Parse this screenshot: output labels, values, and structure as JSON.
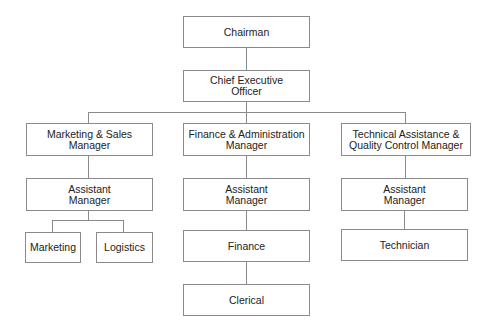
{
  "chart": {
    "type": "org-chart",
    "nodes": {
      "chairman": "Chairman",
      "ceo_line1": "Chief Executive",
      "ceo_line2": "Officer",
      "ms_manager_line1": "Marketing & Sales",
      "ms_manager_line2": "Manager",
      "fa_manager_line1": "Finance & Administration",
      "fa_manager_line2": "Manager",
      "ta_manager_line1": "Technical Assistance &",
      "ta_manager_line2": "Quality Control Manager",
      "asst_line1": "Assistant",
      "asst_line2": "Manager",
      "marketing": "Marketing",
      "logistics": "Logistics",
      "finance": "Finance",
      "technician": "Technician",
      "clerical": "Clerical"
    },
    "hierarchy": {
      "Chairman": [
        "Chief Executive Officer"
      ],
      "Chief Executive Officer": [
        "Marketing & Sales Manager",
        "Finance & Administration Manager",
        "Technical Assistance & Quality Control Manager"
      ],
      "Marketing & Sales Manager": [
        "Assistant Manager (Marketing & Sales)"
      ],
      "Assistant Manager (Marketing & Sales)": [
        "Marketing",
        "Logistics"
      ],
      "Finance & Administration Manager": [
        "Assistant Manager (Finance & Administration)"
      ],
      "Assistant Manager (Finance & Administration)": [
        "Finance"
      ],
      "Finance": [
        "Clerical"
      ],
      "Technical Assistance & Quality Control Manager": [
        "Assistant Manager (Technical)"
      ],
      "Assistant Manager (Technical)": [
        "Technician"
      ]
    }
  }
}
